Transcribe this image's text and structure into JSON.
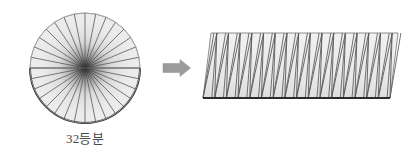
{
  "figure": {
    "caption": "32등분",
    "caption_meaning": "32 equal parts",
    "background_color": "#ffffff"
  },
  "circle": {
    "name": "sector-circle",
    "center_x": 85,
    "center_y": 68,
    "radius": 55,
    "sector_count": 32,
    "fill_color": "#ececec",
    "outline_color": "#9a9a9a",
    "spoke_color": "#5a5a5a",
    "arc_color": "#2b2b2b",
    "highlighted_arc": "bottom-semicircle",
    "diameter_line": "horizontal"
  },
  "arrow": {
    "name": "transform-arrow",
    "direction": "right",
    "x": 163,
    "y": 60,
    "width": 27,
    "height": 16,
    "color": "#9b9b9b"
  },
  "rectangle": {
    "name": "rearranged-rectangle",
    "left": 203,
    "top": 33,
    "right": 398,
    "bottom": 98,
    "width": 195,
    "height": 65,
    "shear": 8,
    "triangle_count": 32,
    "up_triangles": 16,
    "down_triangles": 16,
    "fill_color": "#ececec",
    "outline_color": "#8f8f8f",
    "divider_color": "#5a5a5a",
    "base_color": "#2b2b2b"
  },
  "chart_data": {
    "type": "diagram",
    "shapes": [
      {
        "id": "circle",
        "label": "32등분",
        "divisions": 32,
        "description": "Circle cut into 32 equal pie sectors"
      },
      {
        "id": "arrow",
        "label": "",
        "description": "Rightward transformation arrow"
      },
      {
        "id": "rectangle",
        "label": "",
        "divisions": 32,
        "description": "Sectors interleaved alternately to form a near-rectangle"
      }
    ]
  }
}
